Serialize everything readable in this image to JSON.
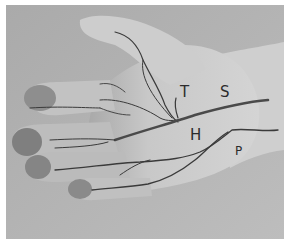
{
  "image": {
    "description": "Grayscale photograph of a palm-up hand with anatomical lines drawn in ink, labeled with letters",
    "labels": [
      {
        "id": "T",
        "text": "T"
      },
      {
        "id": "S",
        "text": "S"
      },
      {
        "id": "H",
        "text": "H"
      },
      {
        "id": "P",
        "text": "P"
      }
    ],
    "colors": {
      "background": "#b4b4b4",
      "skin_light": "#d2d2d2",
      "skin_mid": "#bcbcbc",
      "fingertip": "#8e8e8e",
      "ink": "#3a3a3a"
    }
  }
}
